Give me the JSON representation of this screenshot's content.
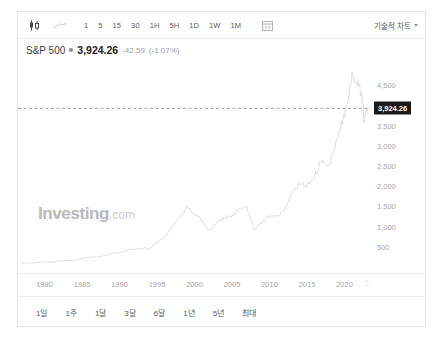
{
  "widget": {
    "provider": "Investing.com",
    "watermark_main": "Investing",
    "watermark_suffix": ".com"
  },
  "toolbar": {
    "chart_type_icon": "candlestick-icon",
    "line_type_icon": "line-chart-icon",
    "calendar_icon": "calendar-icon",
    "intervals": [
      {
        "label": "1"
      },
      {
        "label": "5"
      },
      {
        "label": "15"
      },
      {
        "label": "30"
      },
      {
        "label": "1H"
      },
      {
        "label": "5H"
      },
      {
        "label": "1D"
      },
      {
        "label": "1W"
      },
      {
        "label": "1M"
      }
    ],
    "tech_chart_label": "기술적 차트"
  },
  "header": {
    "symbol": "S&P 500",
    "price": "3,924.26",
    "change": "-42.59",
    "change_pct": "(-1.07%)",
    "change_color": "#9d9d9d"
  },
  "range_bar": {
    "items": [
      {
        "label": "1일"
      },
      {
        "label": "1주"
      },
      {
        "label": "1달"
      },
      {
        "label": "3달"
      },
      {
        "label": "6달"
      },
      {
        "label": "1년"
      },
      {
        "label": "5년"
      },
      {
        "label": "최대"
      }
    ]
  },
  "chart_data": {
    "type": "line",
    "title": "S&P 500",
    "xlabel": "",
    "ylabel": "",
    "grid": false,
    "legend": null,
    "line_color": "#d9d9d9",
    "xlim": [
      1977,
      2023
    ],
    "ylim": [
      0,
      4850
    ],
    "xticks": [
      1980,
      1985,
      1990,
      1995,
      2000,
      2005,
      2010,
      2015,
      2020
    ],
    "yticks": [
      500,
      1000,
      1500,
      2000,
      2500,
      3000,
      3500,
      4500
    ],
    "ytick_labels": [
      "500",
      "1,000",
      "1,500",
      "2,000",
      "2,500",
      "3,000",
      "3,500",
      "4,500"
    ],
    "current_value": 3924.26,
    "current_value_label": "3,924.26",
    "current_value_line": "dashed",
    "x": [
      1977,
      1978,
      1979,
      1980,
      1981,
      1982,
      1983,
      1984,
      1985,
      1986,
      1987,
      1988,
      1989,
      1990,
      1991,
      1992,
      1993,
      1994,
      1995,
      1996,
      1997,
      1998,
      1999,
      2000,
      2001,
      2002,
      2003,
      2004,
      2005,
      2006,
      2007,
      2008,
      2009,
      2010,
      2011,
      2012,
      2013,
      2014,
      2015,
      2016,
      2017,
      2018,
      2019,
      2020,
      2021,
      2021.8,
      2022.3,
      2022.6,
      2023
    ],
    "values": [
      95,
      96,
      108,
      136,
      123,
      141,
      165,
      167,
      211,
      242,
      247,
      278,
      353,
      330,
      417,
      436,
      466,
      459,
      616,
      741,
      970,
      1229,
      1469,
      1320,
      1148,
      880,
      1112,
      1212,
      1248,
      1418,
      1468,
      903,
      1115,
      1258,
      1258,
      1426,
      1848,
      2059,
      2044,
      2239,
      2674,
      2507,
      3231,
      3756,
      4766,
      4550,
      4300,
      3585,
      3924
    ],
    "annotations": [
      {
        "type": "hline",
        "value": 3924.26,
        "label": "3,924.26",
        "style": "dashed"
      }
    ]
  }
}
